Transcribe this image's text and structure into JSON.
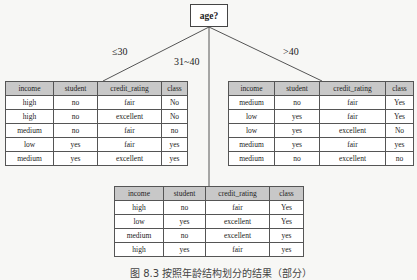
{
  "root": {
    "label": "age?"
  },
  "branches": [
    {
      "condition": "≤30",
      "table": {
        "columns": [
          "income",
          "student",
          "credit_rating",
          "class"
        ],
        "rows": [
          [
            "high",
            "no",
            "fair",
            "No"
          ],
          [
            "high",
            "no",
            "excellent",
            "No"
          ],
          [
            "medium",
            "no",
            "fair",
            "no"
          ],
          [
            "low",
            "yes",
            "fair",
            "yes"
          ],
          [
            "medium",
            "yes",
            "excellent",
            "yes"
          ]
        ]
      }
    },
    {
      "condition": "31~40",
      "table": {
        "columns": [
          "income",
          "student",
          "credit_rating",
          "class"
        ],
        "rows": [
          [
            "high",
            "no",
            "fair",
            "Yes"
          ],
          [
            "low",
            "yes",
            "excellent",
            "Yes"
          ],
          [
            "medium",
            "no",
            "excellent",
            "yes"
          ],
          [
            "high",
            "yes",
            "fair",
            "yes"
          ]
        ]
      }
    },
    {
      "condition": ">40",
      "table": {
        "columns": [
          "income",
          "student",
          "credit_rating",
          "class"
        ],
        "rows": [
          [
            "medium",
            "no",
            "fair",
            "Yes"
          ],
          [
            "low",
            "yes",
            "fair",
            "Yes"
          ],
          [
            "low",
            "yes",
            "excellent",
            "No"
          ],
          [
            "medium",
            "yes",
            "fair",
            "yes"
          ],
          [
            "medium",
            "no",
            "excellent",
            "no"
          ]
        ]
      }
    }
  ],
  "caption": "图 8.3 按照年龄结构划分的结果（部分）"
}
